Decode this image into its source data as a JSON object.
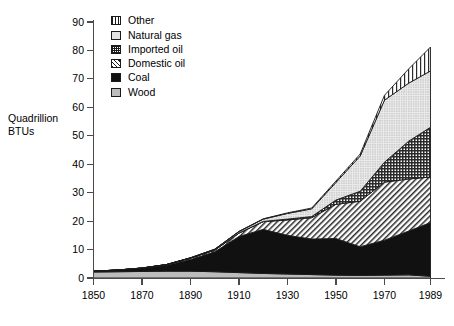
{
  "axis": {
    "y_title_line1": "Quadrillion",
    "y_title_line2": "BTUs",
    "y_ticks": [
      0,
      10,
      20,
      30,
      40,
      50,
      60,
      70,
      80,
      90
    ],
    "x_ticks": [
      1850,
      1870,
      1890,
      1910,
      1930,
      1950,
      1970,
      1989
    ]
  },
  "legend": {
    "items": [
      {
        "label": "Other",
        "swatch": "vertical-stripe-pattern",
        "color": "#ffffff"
      },
      {
        "label": "Natural gas",
        "swatch": "fine-dot-pattern",
        "color": "#e2e2e2"
      },
      {
        "label": "Imported oil",
        "swatch": "crosshatch-pattern",
        "color": "#8a8a8a"
      },
      {
        "label": "Domestic oil",
        "swatch": "diagonal-hatch-pattern",
        "color": "#c9c9c9"
      },
      {
        "label": "Coal",
        "swatch": "solid-fill",
        "color": "#111111"
      },
      {
        "label": "Wood",
        "swatch": "light-gray-fill",
        "color": "#bcbcbc"
      }
    ]
  },
  "chart_data": {
    "type": "area",
    "title": "",
    "xlabel": "",
    "ylabel": "Quadrillion BTUs",
    "xlim": [
      1850,
      1989
    ],
    "ylim": [
      0,
      90
    ],
    "grid": false,
    "legend_position": "top-left-inside",
    "stacked": true,
    "stack_order_bottom_to_top": [
      "Wood",
      "Coal",
      "Domestic oil",
      "Imported oil",
      "Natural gas",
      "Other"
    ],
    "x": [
      1850,
      1860,
      1870,
      1880,
      1890,
      1900,
      1910,
      1920,
      1930,
      1940,
      1950,
      1960,
      1970,
      1980,
      1989
    ],
    "series": [
      {
        "name": "Wood",
        "values": [
          2.1,
          2.2,
          2.3,
          2.4,
          2.4,
          2.2,
          1.9,
          1.6,
          1.4,
          1.2,
          1.0,
          0.9,
          1.0,
          1.1,
          0.6
        ]
      },
      {
        "name": "Coal",
        "values": [
          0.3,
          0.6,
          1.1,
          2.1,
          4.1,
          7.0,
          12.7,
          15.5,
          13.6,
          12.5,
          12.9,
          10.1,
          12.3,
          15.4,
          18.9
        ]
      },
      {
        "name": "Domestic oil",
        "values": [
          0.0,
          0.0,
          0.1,
          0.2,
          0.5,
          0.6,
          1.2,
          2.7,
          5.4,
          7.5,
          12.0,
          16.0,
          20.4,
          18.3,
          16.0
        ]
      },
      {
        "name": "Imported oil",
        "values": [
          0.0,
          0.0,
          0.0,
          0.0,
          0.0,
          0.0,
          0.0,
          0.1,
          0.3,
          0.4,
          1.5,
          3.5,
          7.0,
          13.3,
          17.5
        ]
      },
      {
        "name": "Natural gas",
        "values": [
          0.0,
          0.0,
          0.0,
          0.0,
          0.1,
          0.3,
          0.5,
          0.8,
          2.0,
          2.7,
          6.2,
          12.4,
          21.8,
          20.4,
          19.8
        ]
      },
      {
        "name": "Other",
        "values": [
          0.0,
          0.0,
          0.0,
          0.0,
          0.0,
          0.0,
          0.1,
          0.1,
          0.2,
          0.3,
          0.5,
          0.7,
          1.7,
          5.0,
          8.4
        ]
      }
    ],
    "totals": [
      2.4,
      2.8,
      3.5,
      4.7,
      7.1,
      10.1,
      16.4,
      20.8,
      22.9,
      24.6,
      34.1,
      43.6,
      64.2,
      73.5,
      81.2
    ]
  }
}
